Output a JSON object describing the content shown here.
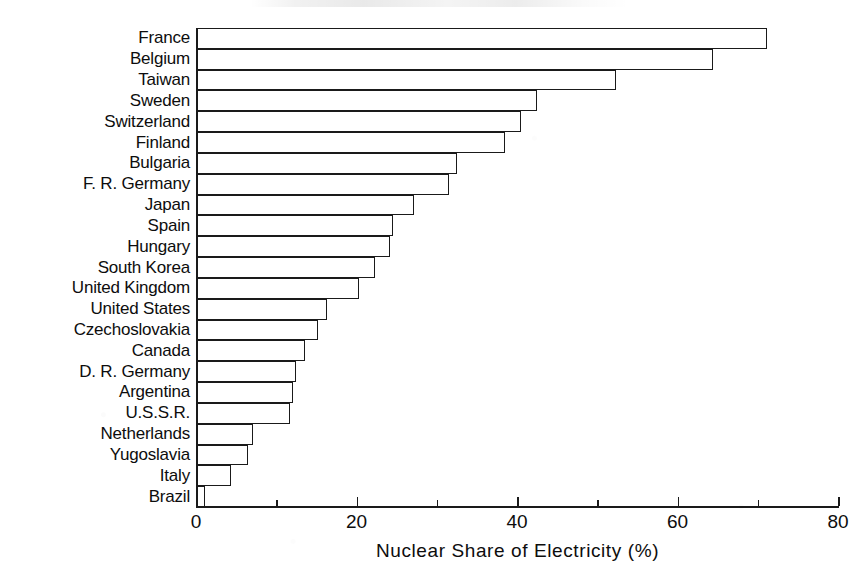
{
  "chart_data": {
    "type": "bar",
    "orientation": "horizontal",
    "title": "",
    "xlabel": "Nuclear Share of Electricity (%)",
    "ylabel": "",
    "xlim": [
      0,
      80
    ],
    "grid": false,
    "legend": null,
    "xticks": [
      0,
      20,
      40,
      60,
      80
    ],
    "xticklabels": [
      "0",
      "20",
      "40",
      "60",
      "80"
    ],
    "xminorticks": [
      10,
      30,
      50,
      70
    ],
    "categories": [
      "France",
      "Belgium",
      "Taiwan",
      "Sweden",
      "Switzerland",
      "Finland",
      "Bulgaria",
      "F. R. Germany",
      "Japan",
      "Spain",
      "Hungary",
      "South Korea",
      "United Kingdom",
      "United States",
      "Czechoslovakia",
      "Canada",
      "D. R. Germany",
      "Argentina",
      "U.S.S.R.",
      "Netherlands",
      "Yugoslavia",
      "Italy",
      "Brazil"
    ],
    "values": [
      71.2,
      64.4,
      52.3,
      42.5,
      40.5,
      38.5,
      32.5,
      31.5,
      27.2,
      24.6,
      24.2,
      22.3,
      20.3,
      16.3,
      15.2,
      13.6,
      12.4,
      12.1,
      11.7,
      7.1,
      6.5,
      4.4,
      1.1
    ],
    "colors": {
      "bar_fill": "#ffffff",
      "bar_edge": "#1a1a1a",
      "axis": "#1a1a1a",
      "text": "#0d0d0d",
      "background": "#ffffff"
    }
  }
}
